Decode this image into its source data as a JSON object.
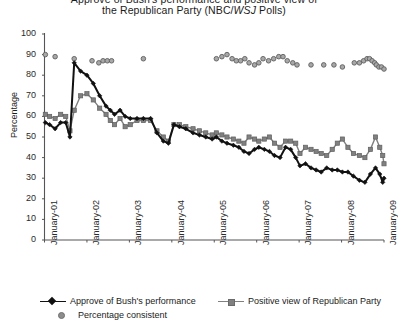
{
  "title": {
    "line1": "Approve of Bush's performance and positive view of",
    "line2_pre": "the Republican Party (NBC/",
    "line2_ital": "WSJ",
    "line2_post": " Polls)"
  },
  "axes": {
    "y_label": "Percentage",
    "y_ticks": [
      0,
      10,
      20,
      30,
      40,
      50,
      60,
      70,
      80,
      90,
      100
    ],
    "x_ticks": [
      "January-01",
      "January-02",
      "January-03",
      "January-04",
      "January-05",
      "January-06",
      "January-07",
      "January-08",
      "January-09"
    ]
  },
  "legend": {
    "items": [
      {
        "label": "Approve of Bush's performance",
        "marker": "line-diamond",
        "color": "#111111"
      },
      {
        "label": "Positive view of Republican Party",
        "marker": "line-square",
        "color": "#808080"
      },
      {
        "label": "Percentage consistent",
        "marker": "dot",
        "color": "#8d8d8d"
      }
    ]
  },
  "colors": {
    "approve": "#111111",
    "positive": "#808080",
    "consistent": "#8d8d8d",
    "axis": "#555555",
    "background": "#ffffff"
  },
  "chart_data": {
    "type": "line",
    "title": "Approve of Bush's performance and positive view of the Republican Party (NBC/WSJ Polls)",
    "xlabel": "",
    "ylabel": "Percentage",
    "ylim": [
      0,
      100
    ],
    "xlim": [
      "January-01",
      "January-09"
    ],
    "grid": false,
    "legend_position": "bottom",
    "x_tick_labels": [
      "January-01",
      "January-02",
      "January-03",
      "January-04",
      "January-05",
      "January-06",
      "January-07",
      "January-08",
      "January-09"
    ],
    "y_tick_values": [
      0,
      10,
      20,
      30,
      40,
      50,
      60,
      70,
      80,
      90,
      100
    ],
    "series": [
      {
        "name": "Approve of Bush's performance",
        "color": "#111111",
        "marker": "diamond",
        "points": [
          [
            2001.02,
            57
          ],
          [
            2001.12,
            56
          ],
          [
            2001.25,
            54
          ],
          [
            2001.38,
            57
          ],
          [
            2001.5,
            57
          ],
          [
            2001.6,
            50
          ],
          [
            2001.7,
            86
          ],
          [
            2001.85,
            82
          ],
          [
            2002.0,
            80
          ],
          [
            2002.15,
            76
          ],
          [
            2002.3,
            70
          ],
          [
            2002.45,
            65
          ],
          [
            2002.55,
            63
          ],
          [
            2002.65,
            61
          ],
          [
            2002.78,
            63
          ],
          [
            2002.9,
            60
          ],
          [
            2003.02,
            59
          ],
          [
            2003.18,
            59
          ],
          [
            2003.33,
            59
          ],
          [
            2003.5,
            59
          ],
          [
            2003.65,
            52
          ],
          [
            2003.8,
            48
          ],
          [
            2003.92,
            47
          ],
          [
            2004.05,
            56
          ],
          [
            2004.18,
            55
          ],
          [
            2004.33,
            54
          ],
          [
            2004.5,
            52
          ],
          [
            2004.65,
            51
          ],
          [
            2004.8,
            50
          ],
          [
            2004.95,
            49
          ],
          [
            2005.05,
            50
          ],
          [
            2005.18,
            48
          ],
          [
            2005.3,
            47
          ],
          [
            2005.45,
            46
          ],
          [
            2005.58,
            45
          ],
          [
            2005.7,
            43
          ],
          [
            2005.82,
            42
          ],
          [
            2005.95,
            44
          ],
          [
            2006.05,
            45
          ],
          [
            2006.18,
            44
          ],
          [
            2006.3,
            43
          ],
          [
            2006.42,
            41
          ],
          [
            2006.55,
            40
          ],
          [
            2006.68,
            45
          ],
          [
            2006.8,
            44
          ],
          [
            2006.92,
            40
          ],
          [
            2007.02,
            36
          ],
          [
            2007.15,
            37
          ],
          [
            2007.28,
            35
          ],
          [
            2007.4,
            34
          ],
          [
            2007.52,
            33
          ],
          [
            2007.65,
            35
          ],
          [
            2007.78,
            34
          ],
          [
            2007.9,
            34
          ],
          [
            2008.02,
            33
          ],
          [
            2008.15,
            33
          ],
          [
            2008.28,
            31
          ],
          [
            2008.42,
            29
          ],
          [
            2008.55,
            28
          ],
          [
            2008.68,
            32
          ],
          [
            2008.8,
            35
          ],
          [
            2008.9,
            32
          ],
          [
            2008.97,
            28
          ],
          [
            2009.0,
            30
          ]
        ]
      },
      {
        "name": "Positive view of Republican Party",
        "color": "#808080",
        "marker": "square",
        "points": [
          [
            2001.02,
            61
          ],
          [
            2001.12,
            60
          ],
          [
            2001.25,
            59
          ],
          [
            2001.38,
            61
          ],
          [
            2001.5,
            60
          ],
          [
            2001.6,
            53
          ],
          [
            2001.7,
            63
          ],
          [
            2001.85,
            70
          ],
          [
            2002.0,
            71
          ],
          [
            2002.15,
            68
          ],
          [
            2002.3,
            64
          ],
          [
            2002.45,
            61
          ],
          [
            2002.55,
            58
          ],
          [
            2002.65,
            56
          ],
          [
            2002.78,
            59
          ],
          [
            2002.9,
            55
          ],
          [
            2003.02,
            56
          ],
          [
            2003.18,
            58
          ],
          [
            2003.33,
            58
          ],
          [
            2003.5,
            58
          ],
          [
            2003.65,
            53
          ],
          [
            2003.8,
            50
          ],
          [
            2003.92,
            48
          ],
          [
            2004.05,
            56
          ],
          [
            2004.18,
            56
          ],
          [
            2004.33,
            55
          ],
          [
            2004.5,
            54
          ],
          [
            2004.65,
            53
          ],
          [
            2004.8,
            52
          ],
          [
            2004.95,
            51
          ],
          [
            2005.05,
            52
          ],
          [
            2005.18,
            51
          ],
          [
            2005.3,
            50
          ],
          [
            2005.45,
            49
          ],
          [
            2005.58,
            48
          ],
          [
            2005.7,
            47
          ],
          [
            2005.82,
            50
          ],
          [
            2005.95,
            49
          ],
          [
            2006.05,
            48
          ],
          [
            2006.18,
            49
          ],
          [
            2006.3,
            50
          ],
          [
            2006.42,
            47
          ],
          [
            2006.55,
            45
          ],
          [
            2006.68,
            48
          ],
          [
            2006.8,
            48
          ],
          [
            2006.92,
            47
          ],
          [
            2007.02,
            42
          ],
          [
            2007.15,
            45
          ],
          [
            2007.28,
            44
          ],
          [
            2007.4,
            43
          ],
          [
            2007.52,
            42
          ],
          [
            2007.65,
            41
          ],
          [
            2007.78,
            44
          ],
          [
            2007.9,
            47
          ],
          [
            2008.02,
            49
          ],
          [
            2008.15,
            45
          ],
          [
            2008.28,
            42
          ],
          [
            2008.42,
            41
          ],
          [
            2008.55,
            40
          ],
          [
            2008.68,
            44
          ],
          [
            2008.8,
            50
          ],
          [
            2008.9,
            45
          ],
          [
            2008.97,
            41
          ],
          [
            2009.0,
            37
          ]
        ]
      },
      {
        "name": "Percentage consistent",
        "color": "#8d8d8d",
        "marker": "circle",
        "style": "scatter",
        "points": [
          [
            2001.02,
            90
          ],
          [
            2001.25,
            89
          ],
          [
            2001.7,
            88
          ],
          [
            2002.12,
            87
          ],
          [
            2002.28,
            86
          ],
          [
            2002.38,
            87
          ],
          [
            2002.48,
            87
          ],
          [
            2002.58,
            87
          ],
          [
            2003.33,
            88
          ],
          [
            2005.05,
            88
          ],
          [
            2005.18,
            89
          ],
          [
            2005.3,
            90
          ],
          [
            2005.42,
            88
          ],
          [
            2005.52,
            87
          ],
          [
            2005.62,
            87
          ],
          [
            2005.72,
            88
          ],
          [
            2005.82,
            86
          ],
          [
            2005.95,
            85
          ],
          [
            2006.05,
            86
          ],
          [
            2006.15,
            88
          ],
          [
            2006.28,
            87
          ],
          [
            2006.4,
            88
          ],
          [
            2006.52,
            89
          ],
          [
            2006.62,
            89
          ],
          [
            2006.72,
            87
          ],
          [
            2006.85,
            86
          ],
          [
            2006.95,
            85
          ],
          [
            2007.28,
            85
          ],
          [
            2007.58,
            85
          ],
          [
            2007.82,
            85
          ],
          [
            2008.02,
            84
          ],
          [
            2008.3,
            86
          ],
          [
            2008.42,
            86
          ],
          [
            2008.52,
            87
          ],
          [
            2008.6,
            88
          ],
          [
            2008.66,
            88
          ],
          [
            2008.72,
            87
          ],
          [
            2008.78,
            86
          ],
          [
            2008.82,
            85
          ],
          [
            2008.88,
            84
          ],
          [
            2008.94,
            84
          ],
          [
            2009.0,
            83
          ]
        ]
      }
    ]
  }
}
